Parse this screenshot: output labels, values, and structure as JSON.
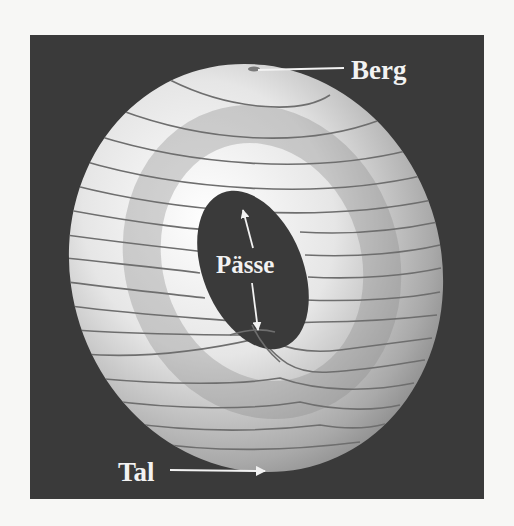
{
  "figure": {
    "background_color": "#3a3a3a",
    "page_color": "#f7f7f5",
    "surface": "torus",
    "labels": {
      "peak": "Berg",
      "saddles": "Pässe",
      "valley": "Tal"
    },
    "colors": {
      "label": "#f2f2f2",
      "contour": "#6e6e6e",
      "arrow": "#f2f2f2"
    }
  }
}
